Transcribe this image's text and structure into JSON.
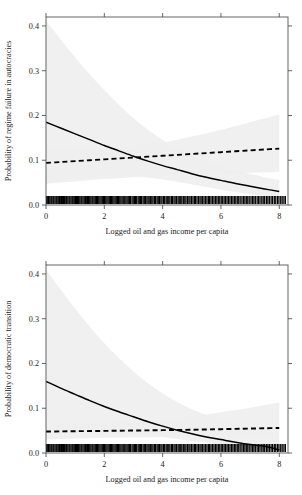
{
  "figure": {
    "background_color": "#ffffff",
    "panel_count": 2
  },
  "style": {
    "band_fill": "#efefef",
    "band_fill_dark": "#e2e2e2",
    "line_color": "#000000",
    "axis_color": "#555555",
    "rug_color": "#000000"
  },
  "chart_data": [
    {
      "type": "line",
      "panel": "top",
      "title": "",
      "xlabel": "Logged oil and gas income per capita",
      "ylabel": "Probability of regime failure in autocracies",
      "xlim": [
        0,
        8.3
      ],
      "ylim": [
        0.0,
        0.42
      ],
      "xticks": [
        0,
        2,
        4,
        6,
        8
      ],
      "xticklabels": [
        "0",
        "2",
        "4",
        "6",
        "8"
      ],
      "yticks": [
        0.0,
        0.1,
        0.2,
        0.3,
        0.4
      ],
      "yticklabels": [
        "0.0",
        "0.1",
        "0.2",
        "0.3",
        "0.4"
      ],
      "grid": false,
      "legend": "none",
      "x": [
        0,
        0.5,
        1,
        1.5,
        2,
        2.5,
        3,
        3.5,
        4,
        4.5,
        5,
        5.5,
        6,
        6.5,
        7,
        7.5,
        8
      ],
      "series": [
        {
          "name": "solid-curve",
          "style": "solid",
          "values": [
            0.185,
            0.172,
            0.159,
            0.146,
            0.133,
            0.121,
            0.109,
            0.098,
            0.088,
            0.079,
            0.07,
            0.062,
            0.055,
            0.048,
            0.042,
            0.036,
            0.03
          ],
          "band_lower": [
            0.05,
            0.055,
            0.059,
            0.062,
            0.064,
            0.065,
            0.064,
            0.061,
            0.057,
            0.052,
            0.046,
            0.04,
            0.034,
            0.029,
            0.024,
            0.02,
            0.016
          ],
          "band_upper": [
            0.412,
            0.37,
            0.33,
            0.292,
            0.257,
            0.224,
            0.194,
            0.168,
            0.145,
            0.126,
            0.11,
            0.097,
            0.086,
            0.077,
            0.069,
            0.062,
            0.056
          ]
        },
        {
          "name": "dashed-line",
          "style": "dashed",
          "values": [
            0.094,
            0.096,
            0.098,
            0.1,
            0.102,
            0.104,
            0.106,
            0.108,
            0.11,
            0.112,
            0.114,
            0.116,
            0.118,
            0.12,
            0.122,
            0.124,
            0.126
          ],
          "band_lower": [
            0.047,
            0.05,
            0.053,
            0.056,
            0.058,
            0.06,
            0.062,
            0.064,
            0.065,
            0.067,
            0.068,
            0.069,
            0.07,
            0.071,
            0.072,
            0.073,
            0.074
          ],
          "band_upper": [
            0.121,
            0.122,
            0.123,
            0.124,
            0.126,
            0.128,
            0.131,
            0.135,
            0.14,
            0.146,
            0.153,
            0.16,
            0.168,
            0.176,
            0.185,
            0.193,
            0.202
          ]
        }
      ],
      "rug": {
        "axis": "x",
        "description": "dense rug of observations along the x axis at y = 0",
        "values": [
          0.02,
          0.06,
          0.09,
          0.13,
          0.17,
          0.2,
          0.24,
          0.27,
          0.31,
          0.35,
          0.38,
          0.42,
          0.46,
          0.49,
          0.53,
          0.57,
          0.6,
          0.64,
          0.68,
          0.71,
          0.75,
          0.79,
          0.82,
          0.86,
          0.9,
          0.93,
          0.97,
          1.01,
          1.05,
          1.08,
          1.12,
          1.16,
          1.2,
          1.23,
          1.27,
          1.31,
          1.35,
          1.38,
          1.42,
          1.46,
          1.5,
          1.54,
          1.58,
          1.61,
          1.65,
          1.69,
          1.73,
          1.77,
          1.81,
          1.85,
          1.89,
          1.93,
          1.97,
          2.01,
          2.05,
          2.09,
          2.13,
          2.17,
          2.21,
          2.25,
          2.29,
          2.33,
          2.37,
          2.41,
          2.45,
          2.49,
          2.53,
          2.57,
          2.61,
          2.65,
          2.7,
          2.74,
          2.78,
          2.82,
          2.86,
          2.9,
          2.95,
          2.99,
          3.03,
          3.07,
          3.11,
          3.16,
          3.2,
          3.24,
          3.28,
          3.33,
          3.37,
          3.41,
          3.46,
          3.5,
          3.54,
          3.59,
          3.63,
          3.67,
          3.72,
          3.76,
          3.81,
          3.85,
          3.89,
          3.94,
          3.98,
          4.03,
          4.07,
          4.12,
          4.16,
          4.21,
          4.25,
          4.3,
          4.34,
          4.39,
          4.43,
          4.48,
          4.53,
          4.57,
          4.62,
          4.66,
          4.71,
          4.76,
          4.8,
          4.85,
          4.9,
          4.94,
          4.99,
          5.04,
          5.09,
          5.13,
          5.18,
          5.23,
          5.28,
          5.32,
          5.37,
          5.42,
          5.47,
          5.52,
          5.57,
          5.61,
          5.66,
          5.71,
          5.76,
          5.81,
          5.86,
          5.91,
          5.96,
          6.01,
          6.06,
          6.11,
          6.16,
          6.21,
          6.26,
          6.31,
          6.36,
          6.41,
          6.46,
          6.51,
          6.56,
          6.61,
          6.66,
          6.72,
          6.77,
          6.82,
          6.87,
          6.92,
          6.97,
          7.03,
          7.08,
          7.13,
          7.18,
          7.24,
          7.29,
          7.34,
          7.4,
          7.45,
          7.5,
          7.56,
          7.61,
          7.66,
          7.72,
          7.77,
          7.83,
          7.88,
          7.94,
          7.99,
          8.05,
          8.1,
          8.16,
          8.21
        ]
      }
    },
    {
      "type": "line",
      "panel": "bottom",
      "title": "",
      "xlabel": "Logged oil and gas income per capita",
      "ylabel": "Probability of democratic transition",
      "xlim": [
        0,
        8.3
      ],
      "ylim": [
        0.0,
        0.42
      ],
      "xticks": [
        0,
        2,
        4,
        6,
        8
      ],
      "xticklabels": [
        "0",
        "2",
        "4",
        "6",
        "8"
      ],
      "yticks": [
        0.0,
        0.1,
        0.2,
        0.3,
        0.4
      ],
      "yticklabels": [
        "0.0",
        "0.1",
        "0.2",
        "0.3",
        "0.4"
      ],
      "grid": false,
      "legend": "none",
      "x": [
        0,
        0.5,
        1,
        1.5,
        2,
        2.5,
        3,
        3.5,
        4,
        4.5,
        5,
        5.5,
        6,
        6.5,
        7,
        7.5,
        8
      ],
      "series": [
        {
          "name": "solid-curve",
          "style": "solid",
          "values": [
            0.16,
            0.145,
            0.131,
            0.117,
            0.104,
            0.092,
            0.081,
            0.07,
            0.06,
            0.051,
            0.043,
            0.036,
            0.03,
            0.024,
            0.019,
            0.015,
            0.007
          ],
          "band_lower": [
            0.04,
            0.043,
            0.045,
            0.046,
            0.046,
            0.045,
            0.043,
            0.04,
            0.036,
            0.031,
            0.027,
            0.023,
            0.019,
            0.015,
            0.012,
            0.009,
            0.004
          ],
          "band_upper": [
            0.41,
            0.365,
            0.322,
            0.282,
            0.245,
            0.212,
            0.182,
            0.156,
            0.133,
            0.114,
            0.098,
            0.085,
            0.074,
            0.064,
            0.056,
            0.049,
            0.036
          ]
        },
        {
          "name": "dashed-line",
          "style": "dashed",
          "values": [
            0.048,
            0.0483,
            0.0487,
            0.049,
            0.0494,
            0.0498,
            0.0502,
            0.0506,
            0.051,
            0.0515,
            0.052,
            0.0526,
            0.0532,
            0.0539,
            0.0546,
            0.0553,
            0.056
          ],
          "band_lower": [
            0.03,
            0.031,
            0.032,
            0.033,
            0.034,
            0.034,
            0.035,
            0.035,
            0.036,
            0.036,
            0.036,
            0.036,
            0.036,
            0.036,
            0.036,
            0.036,
            0.036
          ],
          "band_upper": [
            0.065,
            0.065,
            0.066,
            0.066,
            0.067,
            0.068,
            0.07,
            0.072,
            0.075,
            0.078,
            0.082,
            0.086,
            0.091,
            0.096,
            0.101,
            0.107,
            0.113
          ]
        }
      ],
      "rug": {
        "axis": "x",
        "description": "dense rug of observations along the x axis at y = 0",
        "values": [
          0.02,
          0.06,
          0.09,
          0.13,
          0.17,
          0.2,
          0.24,
          0.27,
          0.31,
          0.35,
          0.38,
          0.42,
          0.46,
          0.49,
          0.53,
          0.57,
          0.6,
          0.64,
          0.68,
          0.71,
          0.75,
          0.79,
          0.82,
          0.86,
          0.9,
          0.93,
          0.97,
          1.01,
          1.05,
          1.08,
          1.12,
          1.16,
          1.2,
          1.23,
          1.27,
          1.31,
          1.35,
          1.38,
          1.42,
          1.46,
          1.5,
          1.54,
          1.58,
          1.61,
          1.65,
          1.69,
          1.73,
          1.77,
          1.81,
          1.85,
          1.89,
          1.93,
          1.97,
          2.01,
          2.05,
          2.09,
          2.13,
          2.17,
          2.21,
          2.25,
          2.29,
          2.33,
          2.37,
          2.41,
          2.45,
          2.49,
          2.53,
          2.57,
          2.61,
          2.65,
          2.7,
          2.74,
          2.78,
          2.82,
          2.86,
          2.9,
          2.95,
          2.99,
          3.03,
          3.07,
          3.11,
          3.16,
          3.2,
          3.24,
          3.28,
          3.33,
          3.37,
          3.41,
          3.46,
          3.5,
          3.54,
          3.59,
          3.63,
          3.67,
          3.72,
          3.76,
          3.81,
          3.85,
          3.89,
          3.94,
          3.98,
          4.03,
          4.07,
          4.12,
          4.16,
          4.21,
          4.25,
          4.3,
          4.34,
          4.39,
          4.43,
          4.48,
          4.53,
          4.57,
          4.62,
          4.66,
          4.71,
          4.76,
          4.8,
          4.85,
          4.9,
          4.94,
          4.99,
          5.04,
          5.09,
          5.13,
          5.18,
          5.23,
          5.28,
          5.32,
          5.37,
          5.42,
          5.47,
          5.52,
          5.57,
          5.61,
          5.66,
          5.71,
          5.76,
          5.81,
          5.86,
          5.91,
          5.96,
          6.01,
          6.06,
          6.11,
          6.16,
          6.21,
          6.26,
          6.31,
          6.36,
          6.41,
          6.46,
          6.51,
          6.56,
          6.61,
          6.66,
          6.72,
          6.77,
          6.82,
          6.87,
          6.92,
          6.97,
          7.03,
          7.08,
          7.13,
          7.18,
          7.24,
          7.29,
          7.34,
          7.4,
          7.45,
          7.5,
          7.56,
          7.61,
          7.66,
          7.72,
          7.77,
          7.83,
          7.88,
          7.94,
          7.99,
          8.05,
          8.1,
          8.16,
          8.21
        ]
      }
    }
  ]
}
